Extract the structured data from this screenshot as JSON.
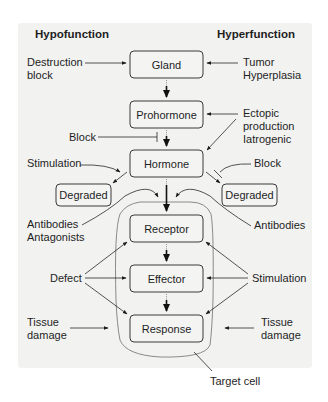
{
  "headers": {
    "left": "Hypofunction",
    "right": "Hyperfunction"
  },
  "boxes": {
    "gland": "Gland",
    "prohormone": "Prohormone",
    "hormone": "Hormone",
    "receptor": "Receptor",
    "effector": "Effector",
    "response": "Response",
    "degraded_left": "Degraded",
    "degraded_right": "Degraded"
  },
  "left_labels": {
    "destruction": [
      "Destruction",
      "block"
    ],
    "block": "Block",
    "stimulation": "Stimulation",
    "antibodies": [
      "Antibodies",
      "Antagonists"
    ],
    "defect": "Defect",
    "tissue_damage": [
      "Tissue",
      "damage"
    ]
  },
  "right_labels": {
    "tumor": [
      "Tumor",
      "Hyperplasia"
    ],
    "ectopic": [
      "Ectopic",
      "production",
      "Iatrogenic"
    ],
    "block": "Block",
    "antibodies": "Antibodies",
    "stimulation": "Stimulation",
    "tissue_damage": [
      "Tissue",
      "damage"
    ]
  },
  "target_cell_label": "Target cell",
  "colors": {
    "panel": "#f2f2f1",
    "box_fill": "#f4f4f3",
    "box_stroke": "#3a3a3a",
    "cell_outline": "#8a8a8a",
    "text": "#1e1e1e"
  }
}
